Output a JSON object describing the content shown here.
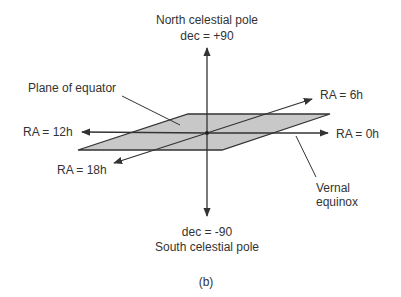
{
  "diagram": {
    "labels": {
      "north_pole": "North celestial pole",
      "dec_plus": "dec = +90",
      "dec_minus": "dec = -90",
      "south_pole": "South celestial pole",
      "plane": "Plane of equator",
      "ra_12": "RA = 12h",
      "ra_18": "RA = 18h",
      "ra_6": "RA = 6h",
      "ra_0": "RA = 0h",
      "vernal_1": "Vernal",
      "vernal_2": "equinox",
      "caption": "(b)"
    },
    "colors": {
      "plane_fill": "#c8c8c8",
      "line": "#333333"
    }
  }
}
